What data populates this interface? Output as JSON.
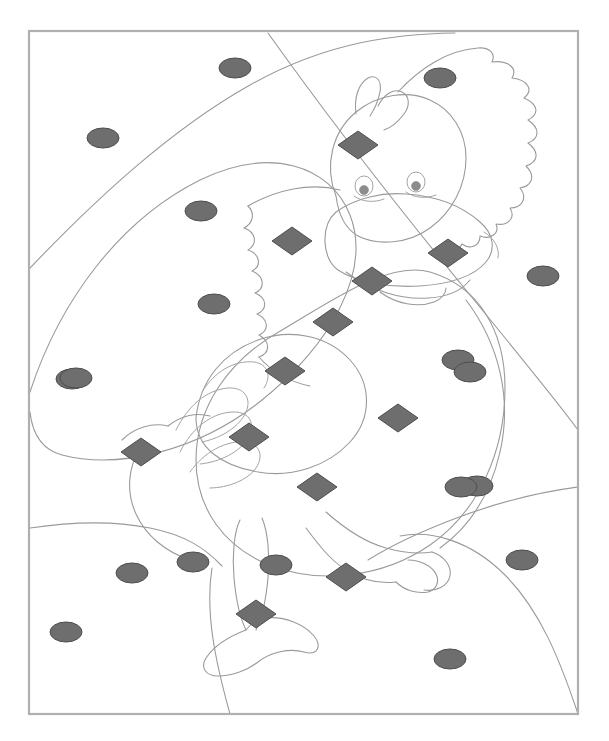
{
  "document": {
    "kind": "coloring-worksheet",
    "title": "Color By Shape - Duck",
    "page_width": 609,
    "page_height": 741,
    "background_color": "#ffffff"
  },
  "frame": {
    "x": 29,
    "y": 31,
    "width": 549,
    "height": 683,
    "stroke_color": "#b0b0b0",
    "stroke_width": 2.2,
    "fill": "none"
  },
  "style": {
    "outline_color": "#9a9a9a",
    "outline_width": 1.1,
    "shape_fill": "#6e6e6e",
    "shape_stroke": "#4d4d4d",
    "shape_stroke_width": 1.0,
    "eye_fill": "#ffffff",
    "eye_pupil_fill": "#8c8c8c"
  },
  "chart_data": {
    "type": "scatter",
    "xlabel": "",
    "ylabel": "",
    "xlim": [
      29,
      578
    ],
    "ylim": [
      31,
      714
    ],
    "grid": false,
    "legend": "none",
    "series": [
      {
        "name": "ellipse-markers",
        "marker": "ellipse",
        "count": 19,
        "fill": "#6e6e6e",
        "points": [
          {
            "cx": 235,
            "cy": 68,
            "rx": 16,
            "ry": 10
          },
          {
            "cx": 440,
            "cy": 78,
            "rx": 16,
            "ry": 10
          },
          {
            "cx": 103,
            "cy": 138,
            "rx": 16,
            "ry": 10
          },
          {
            "cx": 201,
            "cy": 211,
            "rx": 16,
            "ry": 10
          },
          {
            "cx": 543,
            "cy": 276,
            "rx": 16,
            "ry": 10
          },
          {
            "cx": 214,
            "cy": 304,
            "rx": 16,
            "ry": 10
          },
          {
            "cx": 72,
            "cy": 379,
            "rx": 16,
            "ry": 10
          },
          {
            "cx": 458,
            "cy": 360,
            "rx": 16,
            "ry": 10
          },
          {
            "cx": 477,
            "cy": 486,
            "rx": 16,
            "ry": 10
          },
          {
            "cx": 76,
            "cy": 378,
            "rx": 16,
            "ry": 10
          },
          {
            "cx": 74,
            "cy": 377,
            "rx": 16,
            "ry": 10
          },
          {
            "cx": 132,
            "cy": 573,
            "rx": 16,
            "ry": 10
          },
          {
            "cx": 193,
            "cy": 562,
            "rx": 16,
            "ry": 10
          },
          {
            "cx": 276,
            "cy": 565,
            "rx": 16,
            "ry": 10
          },
          {
            "cx": 522,
            "cy": 560,
            "rx": 16,
            "ry": 10
          },
          {
            "cx": 66,
            "cy": 632,
            "rx": 16,
            "ry": 10
          },
          {
            "cx": 450,
            "cy": 659,
            "rx": 16,
            "ry": 10
          },
          {
            "cx": 470,
            "cy": 372,
            "rx": 16,
            "ry": 10
          },
          {
            "cx": 461,
            "cy": 487,
            "rx": 16,
            "ry": 10
          }
        ]
      },
      {
        "name": "diamond-markers",
        "marker": "diamond",
        "count": 12,
        "fill": "#6e6e6e",
        "points": [
          {
            "cx": 358,
            "cy": 145,
            "rx": 20,
            "ry": 14
          },
          {
            "cx": 292,
            "cy": 241,
            "rx": 20,
            "ry": 14
          },
          {
            "cx": 448,
            "cy": 253,
            "rx": 20,
            "ry": 14
          },
          {
            "cx": 372,
            "cy": 281,
            "rx": 20,
            "ry": 14
          },
          {
            "cx": 333,
            "cy": 322,
            "rx": 20,
            "ry": 14
          },
          {
            "cx": 285,
            "cy": 371,
            "rx": 20,
            "ry": 14
          },
          {
            "cx": 398,
            "cy": 418,
            "rx": 20,
            "ry": 14
          },
          {
            "cx": 141,
            "cy": 452,
            "rx": 20,
            "ry": 14
          },
          {
            "cx": 249,
            "cy": 437,
            "rx": 20,
            "ry": 14
          },
          {
            "cx": 317,
            "cy": 487,
            "rx": 20,
            "ry": 14
          },
          {
            "cx": 346,
            "cy": 577,
            "rx": 20,
            "ry": 14
          },
          {
            "cx": 256,
            "cy": 614,
            "rx": 20,
            "ry": 14
          }
        ]
      }
    ]
  },
  "figure": {
    "parts": [
      "background-curves",
      "head",
      "crest",
      "beak",
      "eyes",
      "neck-feathers",
      "body",
      "wing",
      "tail",
      "legs",
      "webbed-feet"
    ]
  }
}
